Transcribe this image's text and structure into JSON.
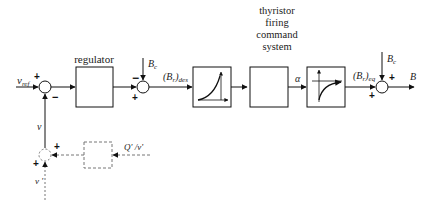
{
  "diagram": {
    "type": "control-block-diagram",
    "inputs": {
      "reference": "v",
      "reference_sub": "ref",
      "feedback": "v",
      "aux_input": "v '",
      "aux_signal": "Q' /v'",
      "compensation_top_1": "B",
      "compensation_top_1_sub": "c",
      "compensation_top_2": "B",
      "compensation_top_2_sub": "c"
    },
    "blocks": {
      "regulator": "regulator",
      "thyristor": [
        "thyristor",
        "firing",
        "command",
        "system"
      ]
    },
    "signals": {
      "b_des": "(B",
      "b_des_inner": "r",
      "b_des_sub": "des",
      "alpha": "α",
      "b_eq": "(B",
      "b_eq_inner": "r",
      "b_eq_sub": "eq",
      "output": "B"
    },
    "signs": {
      "sum1_top": "+",
      "sum1_bottom": "−",
      "sum2_top": "−",
      "sum2_bottom": "+",
      "sum3_top": "+",
      "sum3_bottom": "+",
      "sum4_right": "+",
      "sum4_left": "+"
    },
    "colors": {
      "line": "#111111",
      "dashed": "#777777"
    }
  }
}
